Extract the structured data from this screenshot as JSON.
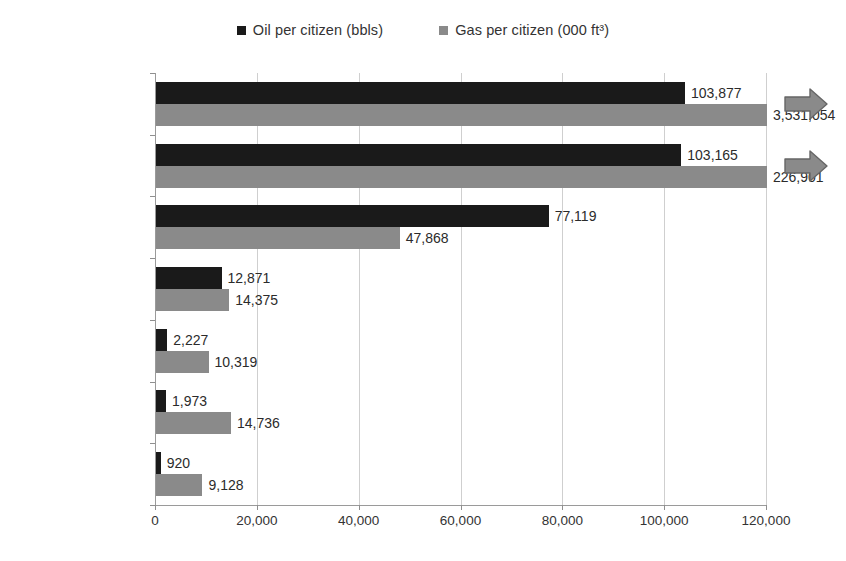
{
  "chart_data": {
    "type": "bar",
    "orientation": "horizontal",
    "title": "",
    "subtitle": "",
    "xlabel": "",
    "ylabel": "",
    "xlim": [
      0,
      120000
    ],
    "xtick_labels": [
      "0",
      "20,000",
      "40,000",
      "60,000",
      "80,000",
      "100,000",
      "120,000"
    ],
    "xticks": [
      0,
      20000,
      40000,
      60000,
      80000,
      100000,
      120000
    ],
    "grid": "vertical",
    "legend_position": "top-center",
    "categories": [
      "Qatar",
      "UAE",
      "Kuwait",
      "Saudi Arabia",
      "Oman",
      "Iran",
      "Bahrain"
    ],
    "series": [
      {
        "name": "Oil per citizen (bbls)",
        "color": "#1a1a1a",
        "values": [
          103877,
          103165,
          77119,
          12871,
          2227,
          1973,
          920
        ],
        "value_labels": [
          "103,877",
          "103,165",
          "77,119",
          "12,871",
          "2,227",
          "1,973",
          "920"
        ]
      },
      {
        "name": "Gas per citizen (000 ft³)",
        "color": "#8a8a8a",
        "values": [
          3531054,
          226901,
          47868,
          14375,
          10319,
          14736,
          9128
        ],
        "value_labels": [
          "3,531,054",
          "226,901",
          "47,868",
          "14,375",
          "10,319",
          "14,736",
          "9,128"
        ],
        "clipped": [
          true,
          true,
          false,
          false,
          false,
          false,
          false
        ]
      }
    ],
    "annotations": [
      {
        "name": "overflow-arrow-qatar",
        "category": "Qatar",
        "meaning": "value extends beyond axis"
      },
      {
        "name": "overflow-arrow-uae",
        "category": "UAE",
        "meaning": "value extends beyond axis"
      }
    ]
  },
  "legend": {
    "entries": [
      {
        "label": "Oil per citizen (bbls)",
        "color": "#1a1a1a",
        "swatch_name": "legend-swatch-oil"
      },
      {
        "label": "Gas per citizen (000 ft³)",
        "color": "#8a8a8a",
        "swatch_name": "legend-swatch-gas"
      }
    ]
  }
}
